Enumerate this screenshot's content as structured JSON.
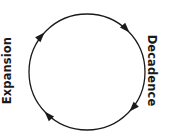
{
  "diagram": {
    "type": "cycle",
    "title": "",
    "background_color": "#ffffff",
    "stroke_color": "#1a1a1a",
    "circle": {
      "center_x": 87,
      "center_y": 72,
      "radius": 58,
      "stroke_width": 1.3,
      "direction": "clockwise"
    },
    "labels": {
      "left": "Expansion",
      "right": "Decadence"
    },
    "arrows": [
      {
        "name": "arrow-upper-left",
        "angle_deg": 137,
        "direction": "clockwise"
      },
      {
        "name": "arrow-upper-right",
        "angle_deg": 43,
        "direction": "clockwise"
      },
      {
        "name": "arrow-lower-left",
        "angle_deg": 223,
        "direction": "clockwise"
      },
      {
        "name": "arrow-lower-right",
        "angle_deg": 317,
        "direction": "clockwise"
      }
    ]
  }
}
